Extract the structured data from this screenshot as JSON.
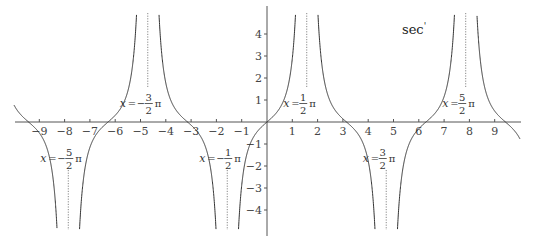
{
  "chart_data": {
    "type": "line",
    "title": "sec'",
    "function": "sec'(x) = sec(x)·tan(x)",
    "xlabel": "",
    "ylabel": "",
    "xlim": [
      -10,
      10
    ],
    "ylim": [
      -4.9,
      4.9
    ],
    "grid": false,
    "legend": "none",
    "x_ticks": [
      -9,
      -8,
      -7,
      -6,
      -5,
      -4,
      -3,
      -2,
      -1,
      1,
      2,
      3,
      4,
      5,
      6,
      7,
      8,
      9
    ],
    "y_ticks": [
      -4,
      -3,
      -2,
      -1,
      1,
      2,
      3,
      4
    ],
    "asymptotes": [
      {
        "x": -7.853981634,
        "label_lhs": "x",
        "sign": "−",
        "num": "5",
        "den": "2",
        "pi": "π",
        "label_side": "below"
      },
      {
        "x": -4.71238898,
        "label_lhs": "x",
        "sign": "−",
        "num": "3",
        "den": "2",
        "pi": "π",
        "label_side": "above"
      },
      {
        "x": -1.570796327,
        "label_lhs": "x",
        "sign": "−",
        "num": "1",
        "den": "2",
        "pi": "π",
        "label_side": "below"
      },
      {
        "x": 1.570796327,
        "label_lhs": "x",
        "sign": "",
        "num": "1",
        "den": "2",
        "pi": "π",
        "label_side": "above"
      },
      {
        "x": 4.71238898,
        "label_lhs": "x",
        "sign": "",
        "num": "3",
        "den": "2",
        "pi": "π",
        "label_side": "below"
      },
      {
        "x": 7.853981634,
        "label_lhs": "x",
        "sign": "",
        "num": "5",
        "den": "2",
        "pi": "π",
        "label_side": "above"
      }
    ],
    "zeros": [
      -9.424777961,
      -6.283185307,
      -3.141592654,
      0,
      3.141592654,
      6.283185307,
      9.424777961
    ],
    "sample_points": [
      {
        "x": -10,
        "y": -1.24
      },
      {
        "x": -9,
        "y": 0.55
      },
      {
        "x": -3,
        "y": 0.14
      },
      {
        "x": -2,
        "y": 5.28
      },
      {
        "x": -1,
        "y": -5.33
      },
      {
        "x": 0,
        "y": 0
      },
      {
        "x": 1,
        "y": 5.33
      },
      {
        "x": 2,
        "y": -5.28
      },
      {
        "x": 3,
        "y": -0.14
      },
      {
        "x": 4,
        "y": 1.75
      },
      {
        "x": 5,
        "y": -33.4
      },
      {
        "x": 6,
        "y": -0.3
      },
      {
        "x": 7,
        "y": 0.97
      },
      {
        "x": 9,
        "y": -0.55
      },
      {
        "x": 10,
        "y": 1.24
      }
    ]
  },
  "view": {
    "origin_px": [
      267,
      122
    ],
    "px_per_unit_x": 25.3,
    "px_per_unit_y": 22,
    "axis_x_range_px": [
      15,
      521
    ],
    "axis_y_range_px": [
      6,
      236
    ],
    "curve_color": "#333333",
    "axis_color": "#555555",
    "asymptote_color": "#888888"
  },
  "labels": {
    "title": "sec",
    "title_prime": "'",
    "equals": "="
  }
}
